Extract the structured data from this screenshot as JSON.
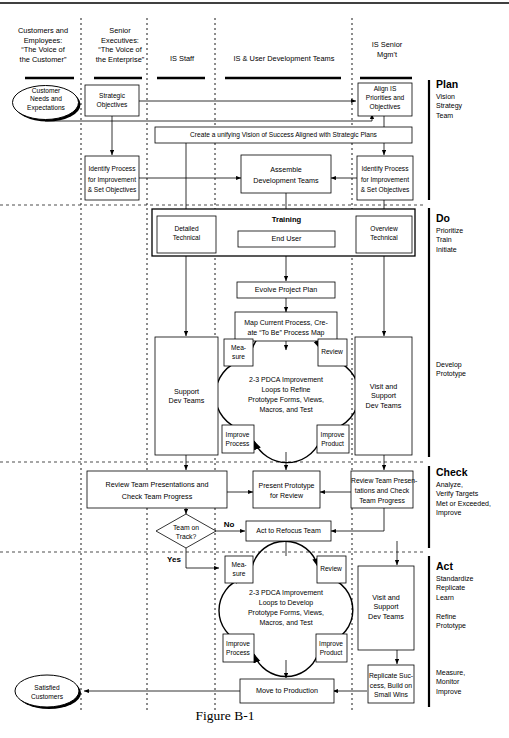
{
  "figure": {
    "caption": "Figure B-1"
  },
  "columns": [
    {
      "id": "customers",
      "lines": [
        "Customers and",
        "Employees:",
        "“The Voice of",
        "the Customer”"
      ]
    },
    {
      "id": "senior-execs",
      "lines": [
        "Senior",
        "Executives:",
        "“The Voice of",
        "the Enterprise”"
      ]
    },
    {
      "id": "is-staff",
      "lines": [
        "IS Staff"
      ]
    },
    {
      "id": "dev-teams",
      "lines": [
        "IS & User Development Teams"
      ]
    },
    {
      "id": "is-senior-mgmt",
      "lines": [
        "IS Senior",
        "Mgm't"
      ]
    }
  ],
  "phases": [
    {
      "id": "plan",
      "title": "Plan",
      "items": [
        "Vision",
        "Strategy",
        "Team"
      ]
    },
    {
      "id": "do",
      "title": "Do",
      "items": [
        "Prioritize",
        "Train",
        "Initiate"
      ]
    },
    {
      "id": "develop",
      "title": "",
      "items": [
        "Develop",
        "Prototype"
      ]
    },
    {
      "id": "check",
      "title": "Check",
      "items": [
        "Analyze,",
        "Verify Targets",
        "Met or Exceeded,",
        "Improve"
      ]
    },
    {
      "id": "act",
      "title": "Act",
      "items": [
        "Standardize",
        "Replicate",
        "Learn"
      ]
    },
    {
      "id": "refine",
      "title": "",
      "items": [
        "Refine",
        "Prototype"
      ]
    },
    {
      "id": "measure",
      "title": "",
      "items": [
        "Measure,",
        "Monitor",
        "Improve"
      ]
    }
  ],
  "nodes": {
    "customer_needs": {
      "lines": [
        "Customer",
        "Needs and",
        "Expectations"
      ]
    },
    "strategic_objectives": {
      "lines": [
        "Strategic",
        "Objectives"
      ]
    },
    "align_is": {
      "lines": [
        "Align IS",
        "Priorities and",
        "Objectives"
      ]
    },
    "unifying_vision": {
      "lines": [
        "Create a unifying Vision of Success Aligned with Strategic Plans"
      ]
    },
    "identify_process_left": {
      "lines": [
        "Identify Process",
        "for Improvement",
        "& Set Objectives"
      ]
    },
    "identify_process_right": {
      "lines": [
        "Identify Process",
        "for Improvement",
        "& Set Objectives"
      ]
    },
    "assemble_teams": {
      "lines": [
        "Assemble",
        "Development Teams"
      ]
    },
    "training_label": {
      "lines": [
        "Training"
      ]
    },
    "detailed_technical": {
      "lines": [
        "Detailed",
        "Technical"
      ]
    },
    "end_user": {
      "lines": [
        "End User"
      ]
    },
    "overview_technical": {
      "lines": [
        "Overview",
        "Technical"
      ]
    },
    "evolve_project_plan": {
      "lines": [
        "Evolve Project Plan"
      ]
    },
    "map_current_process": {
      "lines": [
        "Map Current Process, Cre-",
        "ate “To Be” Process Map"
      ]
    },
    "support_dev_teams": {
      "lines": [
        "Support",
        "Dev Teams"
      ]
    },
    "visit_support_dev_teams_1": {
      "lines": [
        "Visit and",
        "Support",
        "Dev Teams"
      ]
    },
    "pdca1_measure": {
      "lines": [
        "Mea-",
        "sure"
      ]
    },
    "pdca1_review": {
      "lines": [
        "Review"
      ]
    },
    "pdca1_improve_process": {
      "lines": [
        "Improve",
        "Process"
      ]
    },
    "pdca1_improve_product": {
      "lines": [
        "Improve",
        "Product"
      ]
    },
    "pdca1_center": {
      "lines": [
        "2-3 PDCA Improvement",
        "Loops to Refine",
        "Prototype Forms, Views,",
        "Macros, and Test"
      ]
    },
    "review_team_left": {
      "lines": [
        "Review Team Presentations and",
        "Check Team Progress"
      ]
    },
    "present_prototype": {
      "lines": [
        "Present Prototype",
        "for Review"
      ]
    },
    "review_team_right": {
      "lines": [
        "Review Team Presen-",
        "tations and Check",
        "Team Progress"
      ]
    },
    "team_on_track": {
      "lines": [
        "Team on",
        "Track?"
      ]
    },
    "act_to_refocus": {
      "lines": [
        "Act to Refocus Team"
      ]
    },
    "pdca2_measure": {
      "lines": [
        "Mea-",
        "sure"
      ]
    },
    "pdca2_review": {
      "lines": [
        "Review"
      ]
    },
    "pdca2_improve_process": {
      "lines": [
        "Improve",
        "Process"
      ]
    },
    "pdca2_improve_product": {
      "lines": [
        "Improve",
        "Product"
      ]
    },
    "pdca2_center": {
      "lines": [
        "2-3 PDCA Improvement",
        "Loops to Develop",
        "Prototype Forms, Views,",
        "Macros, and Test"
      ]
    },
    "visit_support_dev_teams_2": {
      "lines": [
        "Visit and",
        "Support",
        "Dev Teams"
      ]
    },
    "move_to_production": {
      "lines": [
        "Move to Production"
      ]
    },
    "replicate_success": {
      "lines": [
        "Replicate Suc-",
        "cess, Build on",
        "Small Wins"
      ]
    },
    "satisfied_customers": {
      "lines": [
        "Satisfied",
        "Customers"
      ]
    }
  },
  "edge_labels": {
    "no": "No",
    "yes": "Yes"
  },
  "colors": {
    "line": "#000000",
    "background": "#ffffff",
    "text": "#000000"
  }
}
